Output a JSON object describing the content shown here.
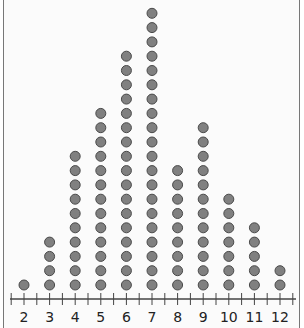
{
  "chart_data": {
    "type": "dot_plot",
    "title": "",
    "xlabel": "",
    "ylabel": "",
    "categories": [
      "2",
      "3",
      "4",
      "5",
      "6",
      "7",
      "8",
      "9",
      "10",
      "11",
      "12"
    ],
    "x": [
      2,
      3,
      4,
      5,
      6,
      7,
      8,
      9,
      10,
      11,
      12
    ],
    "values": [
      1,
      4,
      10,
      13,
      17,
      20,
      9,
      12,
      7,
      5,
      2
    ],
    "xlim": [
      1.5,
      12.5
    ],
    "minor_ticks": 0.5,
    "grid": false,
    "legend": null,
    "dot_color": "#808080",
    "dot_outline": "#4a4a4a"
  }
}
